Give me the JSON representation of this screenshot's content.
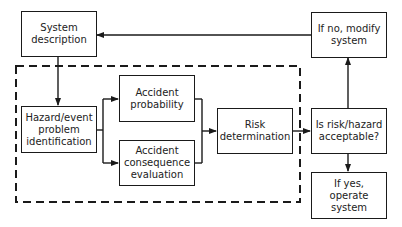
{
  "diagram": {
    "type": "flowchart",
    "nodes": {
      "system_description": "System\ndescription",
      "hazard_identification": "Hazard/event\nproblem\nidentification",
      "accident_probability": "Accident\nprobability",
      "accident_consequence": "Accident\nconsequence\nevaluation",
      "risk_determination": "Risk\ndetermination",
      "acceptable_decision": "Is risk/hazard\nacceptable?",
      "if_no": "If no, modify\nsystem",
      "if_yes": "If yes,\noperate\nsystem"
    },
    "edges": [
      {
        "from": "system_description",
        "to": "hazard_identification"
      },
      {
        "from": "hazard_identification",
        "to": "accident_probability"
      },
      {
        "from": "hazard_identification",
        "to": "accident_consequence"
      },
      {
        "from": "accident_probability",
        "to": "risk_determination"
      },
      {
        "from": "accident_consequence",
        "to": "risk_determination"
      },
      {
        "from": "risk_determination",
        "to": "acceptable_decision"
      },
      {
        "from": "acceptable_decision",
        "to": "if_no"
      },
      {
        "from": "acceptable_decision",
        "to": "if_yes"
      },
      {
        "from": "if_no",
        "to": "system_description"
      }
    ],
    "group": {
      "style": "dashed",
      "contains": [
        "hazard_identification",
        "accident_probability",
        "accident_consequence",
        "risk_determination"
      ]
    },
    "colors": {
      "line": "#1a1a1a",
      "background": "#ffffff"
    }
  }
}
